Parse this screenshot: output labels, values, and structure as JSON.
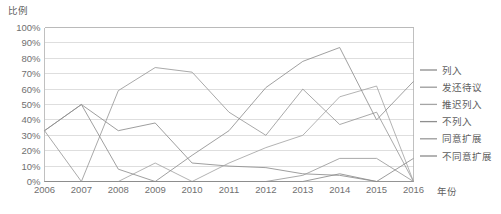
{
  "chart_data": {
    "type": "line",
    "title": "",
    "xlabel": "年份",
    "ylabel": "比例",
    "x": [
      2006,
      2007,
      2008,
      2009,
      2010,
      2011,
      2012,
      2013,
      2014,
      2015,
      2016
    ],
    "categories": [
      "2006",
      "2007",
      "2008",
      "2009",
      "2010",
      "2011",
      "2012",
      "2013",
      "2014",
      "2015",
      "2016"
    ],
    "ylim": [
      0,
      100
    ],
    "yticks": [
      0,
      10,
      20,
      30,
      40,
      50,
      60,
      70,
      80,
      90,
      100
    ],
    "ytick_labels": [
      "0%",
      "10%",
      "20%",
      "30%",
      "40%",
      "50%",
      "60%",
      "70%",
      "80%",
      "90%",
      "100%"
    ],
    "grid": true,
    "legend_position": "right",
    "series": [
      {
        "name": "列入",
        "color": "#8c8c8c",
        "values": [
          33,
          50,
          33,
          38,
          12,
          10,
          9,
          5,
          4,
          0,
          0
        ]
      },
      {
        "name": "发还待议",
        "color": "#9a9a9a",
        "values": [
          33,
          0,
          59,
          74,
          71,
          45,
          30,
          60,
          37,
          45,
          0
        ]
      },
      {
        "name": "推迟列入",
        "color": "#a5a5a5",
        "values": [
          0,
          0,
          0,
          12,
          0,
          12,
          22,
          30,
          55,
          62,
          0
        ]
      },
      {
        "name": "不列入",
        "color": "#8f8f8f",
        "values": [
          33,
          50,
          8,
          0,
          17,
          33,
          61,
          78,
          87,
          40,
          65
        ]
      },
      {
        "name": "同意扩展",
        "color": "#999999",
        "values": [
          0,
          0,
          0,
          0,
          0,
          0,
          0,
          4,
          15,
          15,
          0
        ]
      },
      {
        "name": "不同意扩展",
        "color": "#8a8a8a",
        "values": [
          0,
          0,
          0,
          0,
          0,
          0,
          0,
          0,
          5,
          0,
          15
        ]
      }
    ]
  },
  "legend": {
    "items": [
      {
        "label": "列入"
      },
      {
        "label": "发还待议"
      },
      {
        "label": "推迟列入"
      },
      {
        "label": "不列入"
      },
      {
        "label": "同意扩展"
      },
      {
        "label": "不同意扩展"
      }
    ]
  },
  "axes": {
    "y_axis_title": "比例",
    "x_axis_title": "年份"
  }
}
